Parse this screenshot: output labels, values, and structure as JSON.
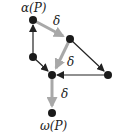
{
  "diagram": {
    "labels": {
      "alpha": "α(P)",
      "omega": "ω(P)",
      "delta1": "δ",
      "delta2": "δ",
      "delta3": "δ"
    },
    "colors": {
      "node": "#1a1a1a",
      "edge_black": "#222222",
      "edge_gray": "#a8a8a8"
    },
    "nodes": [
      {
        "id": "alpha",
        "x": 33,
        "y": 20
      },
      {
        "id": "n2",
        "x": 70,
        "y": 39
      },
      {
        "id": "n3",
        "x": 33,
        "y": 57
      },
      {
        "id": "n4",
        "x": 52,
        "y": 75
      },
      {
        "id": "n5",
        "x": 108,
        "y": 75
      },
      {
        "id": "omega",
        "x": 52,
        "y": 113
      }
    ],
    "edges": [
      {
        "from": "alpha",
        "to": "n2",
        "style": "gray",
        "label": "δ"
      },
      {
        "from": "n2",
        "to": "n4",
        "style": "gray",
        "label": "δ"
      },
      {
        "from": "n4",
        "to": "omega",
        "style": "gray",
        "label": "δ"
      },
      {
        "from": "n3",
        "to": "alpha",
        "style": "black"
      },
      {
        "from": "n3",
        "to": "n4",
        "style": "black"
      },
      {
        "from": "n2",
        "to": "n5",
        "style": "black"
      },
      {
        "from": "n5",
        "to": "n4",
        "style": "black"
      }
    ]
  }
}
